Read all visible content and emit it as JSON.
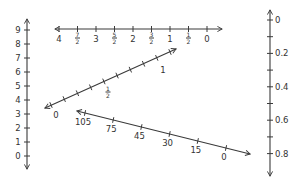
{
  "diagram": {
    "colors": {
      "ink": "#3a3a3a",
      "background": "#ffffff"
    },
    "left_vertical_line": {
      "orientation": "vertical",
      "arrows": "both",
      "labels": [
        "0",
        "1",
        "2",
        "3",
        "4",
        "5",
        "6",
        "7",
        "8",
        "9"
      ]
    },
    "top_horizontal_line": {
      "orientation": "horizontal",
      "arrows": "both",
      "labels": [
        {
          "text": "4"
        },
        {
          "num": "7",
          "den": "2"
        },
        {
          "text": "3"
        },
        {
          "num": "5",
          "den": "2"
        },
        {
          "text": "2"
        },
        {
          "num": "3",
          "den": "2"
        },
        {
          "text": "1"
        },
        {
          "num": "1",
          "den": "2"
        },
        {
          "text": "0"
        }
      ]
    },
    "middle_diagonal_line": {
      "orientation": "diagonal-up",
      "arrows": "both",
      "tick_count": 10,
      "labels": [
        {
          "text": "0"
        },
        {
          "num": "1",
          "den": "2"
        },
        {
          "text": "1"
        }
      ]
    },
    "bottom_diagonal_line": {
      "orientation": "diagonal-down",
      "arrows": "both",
      "labels": [
        "105",
        "75",
        "45",
        "30",
        "15",
        "0"
      ]
    },
    "right_vertical_line": {
      "orientation": "vertical",
      "arrows": "both",
      "labels": [
        "0",
        "0.2",
        "0.4",
        "0.6",
        "0.8"
      ]
    }
  }
}
